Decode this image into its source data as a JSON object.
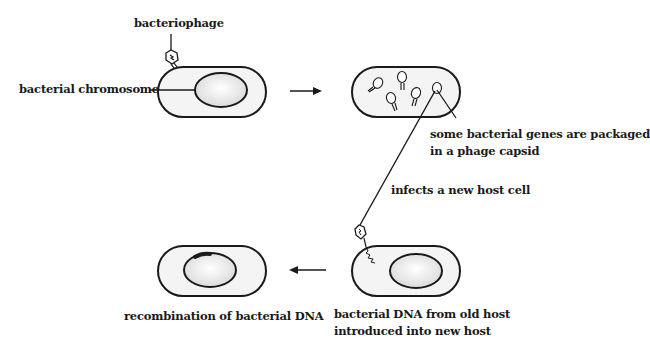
{
  "diagram": {
    "type": "generalized transduction",
    "labels": {
      "bacteriophage": "bacteriophage",
      "bacterial_chromosome": "bacterial chromosome",
      "packaged_line1": "some bacterial genes are packaged",
      "packaged_line2": "in a phage capsid",
      "infects": "infects a new host cell",
      "introduced_line1": "bacterial DNA from old host",
      "introduced_line2": "introduced into new host",
      "recombination": "recombination of bacterial DNA"
    },
    "colors": {
      "stroke": "#1a1a1a",
      "cell_fill": "#f4f4f4",
      "nucleoid_fill": "#e2e2e2",
      "background": "#ffffff"
    },
    "panels": [
      {
        "id": "step1",
        "description": "phage attaches to bacterium"
      },
      {
        "id": "step2",
        "description": "phages assembled inside bacterium"
      },
      {
        "id": "step3",
        "description": "phage injects bacterial DNA into new host"
      },
      {
        "id": "step4",
        "description": "recombination in new host"
      }
    ]
  }
}
